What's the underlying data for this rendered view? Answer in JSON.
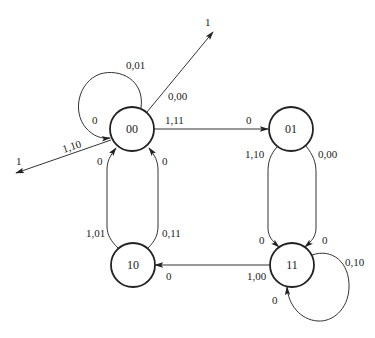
{
  "diagram": {
    "type": "state-transition-diagram",
    "states": [
      {
        "id": "00",
        "label": "00",
        "cx": 132,
        "cy": 129,
        "r": 22
      },
      {
        "id": "01",
        "label": "01",
        "cx": 291,
        "cy": 129,
        "r": 22
      },
      {
        "id": "10",
        "label": "10",
        "cx": 133,
        "cy": 265,
        "r": 22
      },
      {
        "id": "11",
        "label": "11",
        "cx": 292,
        "cy": 265,
        "r": 22
      }
    ],
    "transitions": [
      {
        "from": "00",
        "to": "00",
        "input_output": "0,01",
        "target_label": "0"
      },
      {
        "from": "00",
        "to": "external-up",
        "input_output": "0,00",
        "target_label": "1"
      },
      {
        "from": "00",
        "to": "external-left",
        "input_output": "1,10",
        "target_label": "1"
      },
      {
        "from": "00",
        "to": "01",
        "input_output": "1,11",
        "target_label": "0"
      },
      {
        "from": "01",
        "to": "11",
        "input_output": "1,10",
        "target_label": "0"
      },
      {
        "from": "01",
        "to": "11",
        "input_output": "0,00",
        "target_label": "0"
      },
      {
        "from": "10",
        "to": "00",
        "input_output": "1,01",
        "target_label": "0"
      },
      {
        "from": "10",
        "to": "00",
        "input_output": "0,11",
        "target_label": "0"
      },
      {
        "from": "11",
        "to": "10",
        "input_output": "1,00",
        "target_label": "0"
      },
      {
        "from": "11",
        "to": "11",
        "input_output": "0,10",
        "target_label": "0"
      }
    ],
    "labels": {
      "s00": "00",
      "s01": "01",
      "s10": "10",
      "s11": "11",
      "loop00_io": "0,01",
      "loop00_tgt": "0",
      "up_io": "0,00",
      "up_tgt": "1",
      "left_io": "1,10",
      "left_tgt": "1",
      "e00_01_io": "1,11",
      "e00_01_tgt": "0",
      "e01_11a_io": "1,10",
      "e01_11a_tgt": "0",
      "e01_11b_io": "0,00",
      "e01_11b_tgt": "0",
      "e10_00a_io": "1,01",
      "e10_00a_tgt": "0",
      "e10_00b_io": "0,11",
      "e10_00b_tgt": "0",
      "e11_10_io": "1,00",
      "e11_10_tgt": "0",
      "loop11_io": "0,10",
      "loop11_tgt": "0"
    }
  }
}
